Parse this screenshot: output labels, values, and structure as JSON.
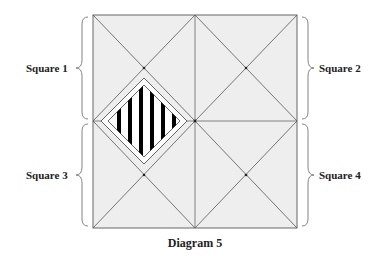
{
  "diagram": {
    "caption": "Diagram 5",
    "squares": [
      {
        "id": 1,
        "label": "Square 1",
        "side": "left"
      },
      {
        "id": 2,
        "label": "Square 2",
        "side": "right"
      },
      {
        "id": 3,
        "label": "Square 3",
        "side": "left"
      },
      {
        "id": 4,
        "label": "Square 4",
        "side": "right"
      }
    ],
    "shaded_region": "hatched diamond with vertical black stripes",
    "colors": {
      "square_fill": "#eeeeee",
      "line": "#555555",
      "stripes": "#000000"
    }
  }
}
